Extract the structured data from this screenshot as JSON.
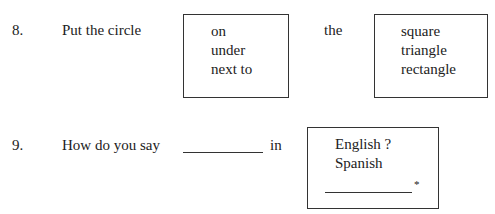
{
  "items": [
    {
      "number": "8.",
      "prompt": "Put the circle",
      "box1_options": [
        "on",
        "under",
        "next to"
      ],
      "connector": "the",
      "box2_options": [
        "square",
        "triangle",
        "rectangle"
      ]
    },
    {
      "number": "9.",
      "prompt": "How do you say",
      "after_blank": "in",
      "box_options": [
        "English ?",
        "Spanish"
      ],
      "footnote_marker": "*"
    }
  ]
}
